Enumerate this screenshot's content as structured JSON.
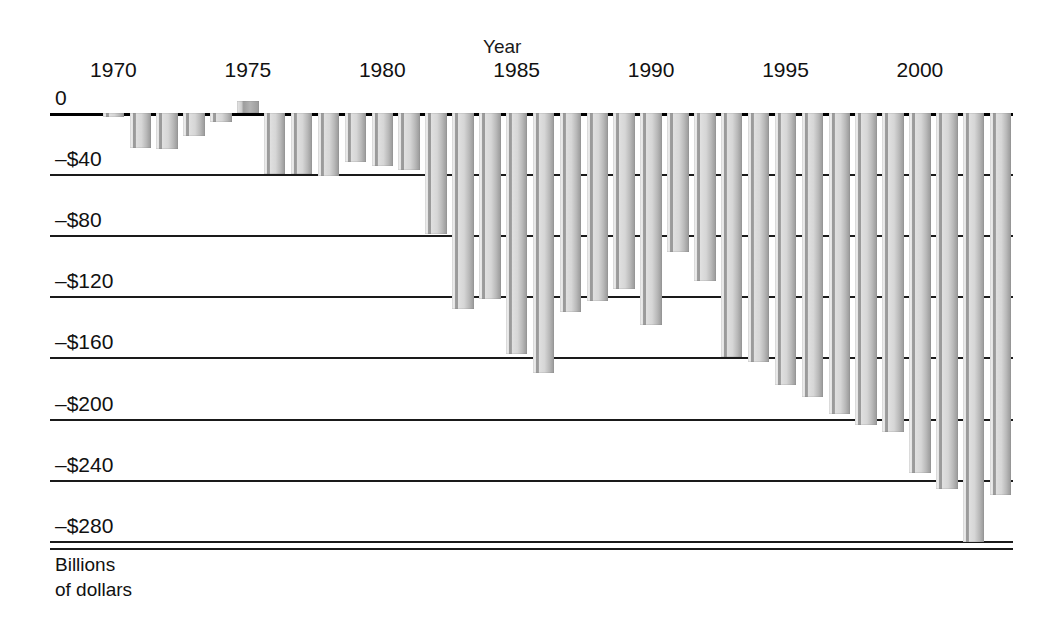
{
  "chart_data": {
    "type": "bar",
    "title": "",
    "xlabel": "Year",
    "ylabel": "Billions of dollars",
    "ylim": [
      -290,
      10
    ],
    "grid": true,
    "legend": "none",
    "orientation": "vertical",
    "y_tick_labels": [
      "0",
      "–$40",
      "–$80",
      "–$120",
      "–$160",
      "–$200",
      "–$240",
      "–$280"
    ],
    "y_tick_values": [
      0,
      -40,
      -80,
      -120,
      -160,
      -200,
      -240,
      -280
    ],
    "x_tick_labels": [
      "1970",
      "1975",
      "1980",
      "1985",
      "1990",
      "1995",
      "2000"
    ],
    "x_tick_values": [
      1970,
      1975,
      1980,
      1985,
      1990,
      1995,
      2000
    ],
    "categories": [
      "1970",
      "1971",
      "1972",
      "1973",
      "1974",
      "1975",
      "1976",
      "1977",
      "1978",
      "1979",
      "1980",
      "1981",
      "1982",
      "1983",
      "1984",
      "1985",
      "1986",
      "1987",
      "1988",
      "1989",
      "1990",
      "1991",
      "1992",
      "1993",
      "1994",
      "1995",
      "1996",
      "1997",
      "1998",
      "1999",
      "2000",
      "2001",
      "2002",
      "2003"
    ],
    "values": [
      -2.8,
      -23.0,
      -23.4,
      -14.9,
      -6.1,
      8.0,
      -40.0,
      -40.0,
      -41.0,
      -32.0,
      -35.0,
      -37.0,
      -79.0,
      -128.0,
      -122.0,
      -158.0,
      -170.0,
      -130.0,
      -123.0,
      -115.0,
      -139.0,
      -91.0,
      -110.0,
      -160.0,
      -163.0,
      -178.0,
      -186.0,
      -197.0,
      -204.0,
      -209.0,
      -236.0,
      -246.0,
      -281.0,
      -250.0
    ],
    "series": [
      {
        "name": "Federal budget deficit",
        "values": [
          -2.8,
          -23.0,
          -23.4,
          -14.9,
          -6.1,
          8.0,
          -40.0,
          -40.0,
          -41.0,
          -32.0,
          -35.0,
          -37.0,
          -79.0,
          -128.0,
          -122.0,
          -158.0,
          -170.0,
          -130.0,
          -123.0,
          -115.0,
          -139.0,
          -91.0,
          -110.0,
          -160.0,
          -163.0,
          -178.0,
          -186.0,
          -197.0,
          -204.0,
          -209.0,
          -236.0,
          -246.0,
          -281.0,
          -250.0
        ]
      }
    ],
    "bar_fill_color": "#b8b8b8",
    "axis_color": "#1a1a1a"
  },
  "axes": {
    "x_title": "Year",
    "unit_label": "Billions\nof dollars"
  }
}
